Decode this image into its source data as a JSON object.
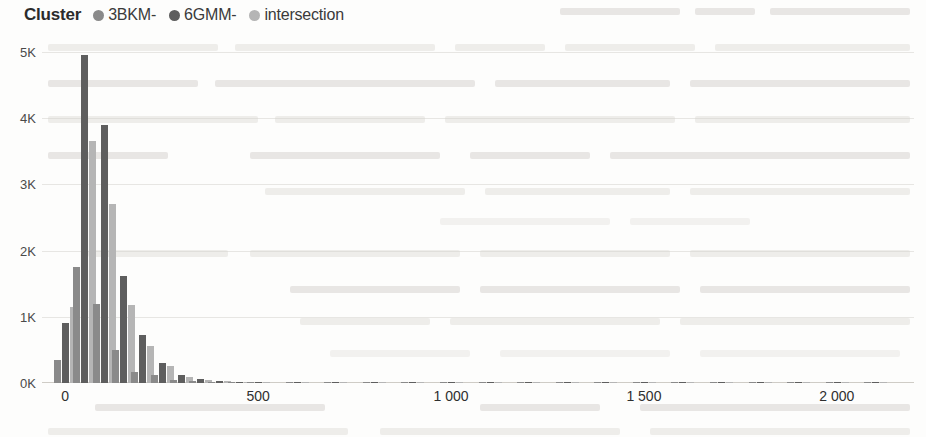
{
  "legend": {
    "title": "Cluster",
    "items": [
      {
        "label": "3BKM-",
        "color": "#8a8a8a",
        "icon": "legend-dot-icon"
      },
      {
        "label": "6GMM-",
        "color": "#5e5e5e",
        "icon": "legend-dot-icon"
      },
      {
        "label": "intersection",
        "color": "#b5b5b5",
        "icon": "legend-dot-icon"
      }
    ]
  },
  "chart_data": {
    "type": "bar",
    "title": "",
    "xlabel": "",
    "ylabel": "",
    "grid": true,
    "legend_position": "top-left",
    "ylim": [
      0,
      5000
    ],
    "xlim": [
      -60,
      2200
    ],
    "ytick_labels": [
      "0K",
      "1K",
      "2K",
      "3K",
      "4K",
      "5K"
    ],
    "ytick_values": [
      0,
      1000,
      2000,
      3000,
      4000,
      5000
    ],
    "xtick_labels": [
      "0",
      "500",
      "1 000",
      "1 500",
      "2 000"
    ],
    "xtick_values": [
      0,
      500,
      1000,
      1500,
      2000
    ],
    "x": [
      0,
      50,
      100,
      150,
      200,
      250,
      300,
      350,
      400,
      450,
      500,
      600,
      700,
      800,
      900,
      1000,
      1100,
      1200,
      1300,
      1400,
      1500,
      1600,
      1700,
      1800,
      1900,
      2000,
      2100
    ],
    "series": [
      {
        "name": "3BKM-",
        "color": "#8a8a8a",
        "values": [
          350,
          1750,
          1200,
          500,
          170,
          120,
          40,
          25,
          15,
          10,
          8,
          6,
          5,
          5,
          4,
          4,
          3,
          3,
          3,
          2,
          2,
          2,
          2,
          2,
          2,
          2,
          2
        ]
      },
      {
        "name": "6GMM-",
        "color": "#5e5e5e",
        "values": [
          900,
          4950,
          3900,
          1620,
          730,
          300,
          120,
          60,
          30,
          20,
          14,
          10,
          8,
          7,
          6,
          5,
          5,
          4,
          4,
          4,
          3,
          3,
          3,
          3,
          3,
          3,
          2
        ]
      },
      {
        "name": "intersection",
        "color": "#b5b5b5",
        "values": [
          1150,
          3650,
          2700,
          1180,
          560,
          250,
          90,
          45,
          25,
          16,
          11,
          8,
          7,
          6,
          5,
          4,
          4,
          3,
          3,
          3,
          3,
          2,
          2,
          2,
          2,
          2,
          2
        ]
      }
    ]
  }
}
